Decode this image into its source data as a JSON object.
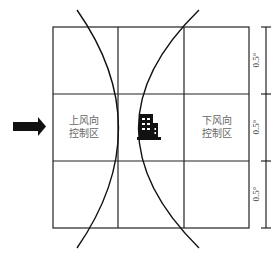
{
  "diagram": {
    "zones": {
      "upwind": {
        "line1": "上风向",
        "line2": "控制区"
      },
      "downwind": {
        "line1": "下风向",
        "line2": "控制区"
      }
    },
    "dimensions": [
      "0.5°",
      "0.5°",
      "0.5°"
    ],
    "icons": {
      "wind_arrow": "arrow-right-icon",
      "building": "building-icon"
    },
    "colors": {
      "line": "#111111",
      "label": "#666666"
    }
  }
}
